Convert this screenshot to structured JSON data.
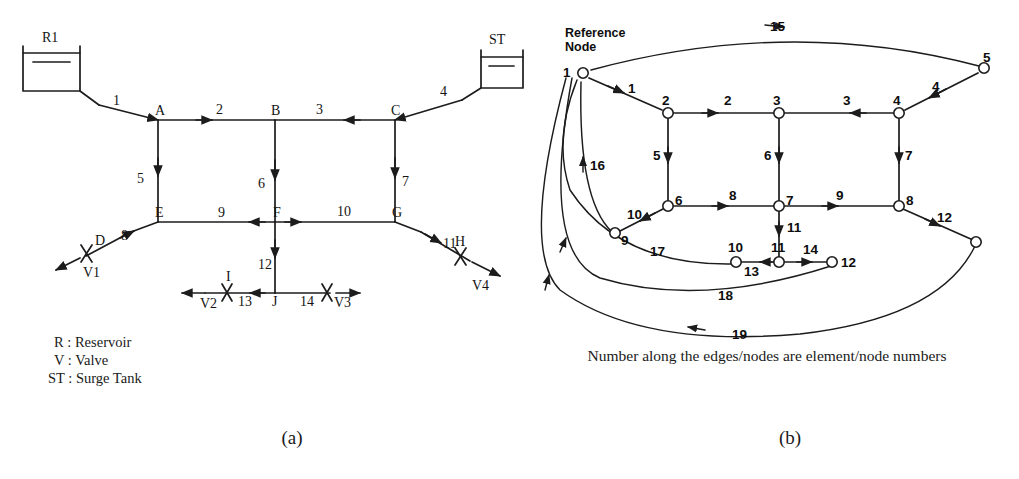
{
  "figure": {
    "subcaptions": {
      "left": "(a)",
      "right": "(b)"
    },
    "caption_right": "Number along the edges/nodes are element/node numbers"
  },
  "panel_a": {
    "name": "pipe-network-schematic",
    "reservoir": {
      "label": "R1"
    },
    "surge_tank": {
      "label": "ST"
    },
    "junction_nodes": [
      "A",
      "B",
      "C",
      "D",
      "E",
      "F",
      "G",
      "H",
      "I",
      "J"
    ],
    "node_labels": {
      "A": "A",
      "B": "B",
      "C": "C",
      "D": "D",
      "E": "E",
      "F": "F",
      "G": "G",
      "H": "H",
      "I": "I",
      "J": "J"
    },
    "valves": [
      "V1",
      "V2",
      "V3",
      "V4"
    ],
    "pipe_numbers": [
      "1",
      "2",
      "3",
      "4",
      "5",
      "6",
      "7",
      "8",
      "9",
      "10",
      "11",
      "12",
      "13",
      "14"
    ],
    "legend": [
      {
        "symbol": "R",
        "sep": ":",
        "meaning": "Reservoir"
      },
      {
        "symbol": "V",
        "sep": ":",
        "meaning": "Valve"
      },
      {
        "symbol": "ST",
        "sep": ":",
        "meaning": "Surge Tank"
      }
    ],
    "legend_lines": [
      "R : Reservoir",
      "V : Valve",
      "ST : Surge Tank"
    ]
  },
  "panel_b": {
    "name": "network-graph",
    "reference_node_label_line1": "Reference",
    "reference_node_label_line2": "Node",
    "node_numbers": [
      "1",
      "2",
      "3",
      "4",
      "5",
      "6",
      "7",
      "8",
      "9",
      "10",
      "11",
      "12"
    ],
    "element_numbers": [
      "1",
      "2",
      "3",
      "4",
      "5",
      "6",
      "7",
      "8",
      "9",
      "10",
      "11",
      "12",
      "13",
      "14",
      "15",
      "16",
      "17",
      "18",
      "19"
    ]
  },
  "graph_data": {
    "type": "diagram",
    "panel_a_nodes": [
      {
        "id": "R1",
        "x": 51,
        "y": 68,
        "kind": "reservoir"
      },
      {
        "id": "ST",
        "x": 501,
        "y": 69,
        "kind": "surge-tank"
      },
      {
        "id": "A",
        "x": 158,
        "y": 120,
        "kind": "junction"
      },
      {
        "id": "B",
        "x": 275,
        "y": 120,
        "kind": "junction"
      },
      {
        "id": "C",
        "x": 395,
        "y": 120,
        "kind": "junction"
      },
      {
        "id": "E",
        "x": 158,
        "y": 222,
        "kind": "junction"
      },
      {
        "id": "F",
        "x": 275,
        "y": 222,
        "kind": "junction"
      },
      {
        "id": "G",
        "x": 395,
        "y": 222,
        "kind": "junction"
      },
      {
        "id": "D",
        "x": 104,
        "y": 247,
        "kind": "valve-node"
      },
      {
        "id": "H",
        "x": 452,
        "y": 249,
        "kind": "valve-node"
      },
      {
        "id": "I",
        "x": 232,
        "y": 293,
        "kind": "valve-node"
      },
      {
        "id": "J",
        "x": 275,
        "y": 293,
        "kind": "junction"
      }
    ],
    "panel_a_pipes": [
      {
        "n": "1",
        "from": "R1",
        "to": "A"
      },
      {
        "n": "2",
        "from": "A",
        "to": "B"
      },
      {
        "n": "3",
        "from": "C",
        "to": "B"
      },
      {
        "n": "4",
        "from": "ST",
        "to": "C"
      },
      {
        "n": "5",
        "from": "A",
        "to": "E"
      },
      {
        "n": "6",
        "from": "B",
        "to": "F"
      },
      {
        "n": "7",
        "from": "C",
        "to": "G"
      },
      {
        "n": "8",
        "from": "E",
        "to": "D"
      },
      {
        "n": "9",
        "from": "F",
        "to": "E"
      },
      {
        "n": "10",
        "from": "F",
        "to": "G"
      },
      {
        "n": "11",
        "from": "G",
        "to": "H"
      },
      {
        "n": "12",
        "from": "F",
        "to": "J"
      },
      {
        "n": "13",
        "from": "J",
        "to": "I"
      },
      {
        "n": "14",
        "from": "J",
        "to": "V3"
      }
    ],
    "panel_b_nodes": [
      {
        "n": "1",
        "x": 583,
        "y": 73
      },
      {
        "n": "2",
        "x": 668,
        "y": 113
      },
      {
        "n": "3",
        "x": 779,
        "y": 113
      },
      {
        "n": "4",
        "x": 899,
        "y": 113
      },
      {
        "n": "5",
        "x": 984,
        "y": 68
      },
      {
        "n": "6",
        "x": 668,
        "y": 206
      },
      {
        "n": "7",
        "x": 779,
        "y": 206
      },
      {
        "n": "8",
        "x": 899,
        "y": 206
      },
      {
        "n": "9",
        "x": 615,
        "y": 233
      },
      {
        "n": "10",
        "x": 736,
        "y": 262
      },
      {
        "n": "11",
        "x": 779,
        "y": 262
      },
      {
        "n": "12",
        "x": 832,
        "y": 262
      },
      {
        "n": "",
        "x": 976,
        "y": 242
      }
    ],
    "panel_b_edges": [
      {
        "n": "1",
        "from": "1",
        "to": "2"
      },
      {
        "n": "2",
        "from": "2",
        "to": "3"
      },
      {
        "n": "3",
        "from": "4",
        "to": "3"
      },
      {
        "n": "4",
        "from": "5",
        "to": "4"
      },
      {
        "n": "5",
        "from": "2",
        "to": "6"
      },
      {
        "n": "6",
        "from": "3",
        "to": "7"
      },
      {
        "n": "7",
        "from": "4",
        "to": "8"
      },
      {
        "n": "8",
        "from": "6",
        "to": "7"
      },
      {
        "n": "9",
        "from": "7",
        "to": "8"
      },
      {
        "n": "10",
        "from": "6",
        "to": "9"
      },
      {
        "n": "11",
        "from": "7",
        "to": "11"
      },
      {
        "n": "12",
        "from": "8",
        "to": "unlabeled"
      },
      {
        "n": "13",
        "from": "11",
        "to": "10"
      },
      {
        "n": "14",
        "from": "11",
        "to": "12"
      },
      {
        "n": "15",
        "from": "1",
        "to": "5"
      },
      {
        "n": "16",
        "from": "9",
        "to": "1"
      },
      {
        "n": "17",
        "from": "10",
        "to": "1"
      },
      {
        "n": "18",
        "from": "12",
        "to": "1"
      },
      {
        "n": "19",
        "from": "unlabeled",
        "to": "1"
      }
    ]
  }
}
